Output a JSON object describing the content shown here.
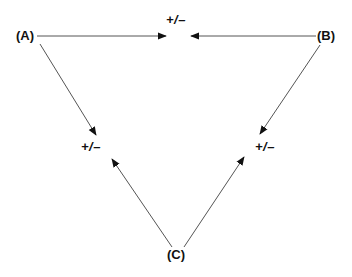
{
  "diagram": {
    "nodes": [
      {
        "id": "A",
        "label": "(A)"
      },
      {
        "id": "B",
        "label": "(B)"
      },
      {
        "id": "C",
        "label": "(C)"
      }
    ],
    "edge_labels": {
      "top": "+/–",
      "left": "+/–",
      "right": "+/–"
    },
    "edges": [
      {
        "from": "A",
        "to": "top",
        "sign": "+/–"
      },
      {
        "from": "B",
        "to": "top",
        "sign": "+/–"
      },
      {
        "from": "A",
        "to": "left",
        "sign": "+/–"
      },
      {
        "from": "C",
        "to": "left",
        "sign": "+/–"
      },
      {
        "from": "B",
        "to": "right",
        "sign": "+/–"
      },
      {
        "from": "C",
        "to": "right",
        "sign": "+/–"
      }
    ],
    "colors": {
      "line": "#555555",
      "arrowhead": "#111111",
      "text": "#111111",
      "background": "#ffffff"
    }
  }
}
